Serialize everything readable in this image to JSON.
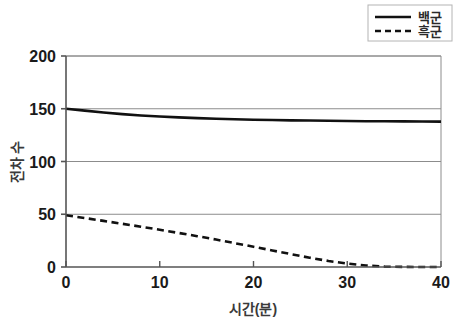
{
  "chart_data": {
    "type": "line",
    "title": "",
    "xlabel": "시간(분)",
    "ylabel": "전차 수",
    "xlim": [
      0,
      40
    ],
    "ylim": [
      0,
      200
    ],
    "xticks": [
      0,
      10,
      20,
      30,
      40
    ],
    "yticks": [
      0,
      50,
      100,
      150,
      200
    ],
    "xtick_labels": [
      "0",
      "10",
      "20",
      "30",
      "40"
    ],
    "ytick_labels": [
      "0",
      "50",
      "100",
      "150",
      "200"
    ],
    "grid": "horizontal",
    "legend_position": "top-right",
    "x": [
      0,
      2,
      4,
      6,
      8,
      10,
      12,
      14,
      16,
      18,
      20,
      22,
      24,
      26,
      28,
      30,
      32,
      34,
      36,
      38,
      40
    ],
    "series": [
      {
        "name": "백군",
        "style": "solid",
        "color": "#111111",
        "values": [
          150,
          148.2,
          146.4,
          144.9,
          143.6,
          142.6,
          141.8,
          141.1,
          140.5,
          140.0,
          139.6,
          139.3,
          139.0,
          138.8,
          138.6,
          138.4,
          138.2,
          138.1,
          138.0,
          137.9,
          137.8
        ]
      },
      {
        "name": "흑군",
        "style": "dashed",
        "color": "#111111",
        "values": [
          49,
          46.4,
          43.7,
          41.0,
          38.2,
          35.3,
          32.3,
          29.2,
          26.0,
          22.6,
          19.2,
          15.7,
          12.2,
          8.8,
          5.7,
          3.2,
          1.4,
          0.4,
          0.1,
          0,
          0
        ]
      }
    ]
  },
  "legend": {
    "items": [
      {
        "label": "백군",
        "style": "solid"
      },
      {
        "label": "흑군",
        "style": "dashed"
      }
    ]
  },
  "axes": {
    "x_title": "시간(분)",
    "y_title": "전차 수"
  },
  "colors": {
    "line": "#111111",
    "grid": "#8c8c8c",
    "axis": "#6e6e6e",
    "text": "#1a1a1a",
    "background": "#ffffff"
  }
}
